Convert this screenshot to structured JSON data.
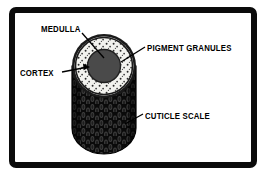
{
  "figure": {
    "frame_color": "#0b0b0b",
    "background_color": "#ffffff"
  },
  "labels": {
    "medulla": "MEDULLA",
    "pigment_granules": "PIGMENT GRANULES",
    "cortex": "CORTEX",
    "cuticle_scale": "CUTICLE SCALE"
  },
  "diagram": {
    "parts": [
      {
        "name": "medulla",
        "label": "MEDULLA",
        "description": "solid dark central core circle of the hair cross-section",
        "color": "#4a4a4a",
        "leader_from": [
          82,
          33
        ],
        "leader_to": [
          104,
          56
        ]
      },
      {
        "name": "cortex",
        "label": "CORTEX",
        "description": "light speckled ring surrounding the medulla",
        "color": "#f2f2ee",
        "leader_from": [
          62,
          72
        ],
        "leader_to": [
          88,
          66
        ]
      },
      {
        "name": "pigment-granules",
        "label": "PIGMENT GRANULES",
        "description": "small dark dots distributed through the cortex ring",
        "color": "#2a2a2a",
        "leader_from": [
          145,
          47
        ],
        "leader_to": [
          120,
          63
        ]
      },
      {
        "name": "cuticle-scale",
        "label": "CUTICLE SCALE",
        "description": "overlapping dark scales covering the outer cylinder shaft",
        "color": "#111111",
        "leader_from": [
          143,
          114
        ],
        "leader_to": [
          124,
          124
        ]
      }
    ],
    "colors": {
      "outer_rim": "#1a1a1a",
      "cortex_fill": "#f2f2ee",
      "medulla_fill": "#4a4a4a",
      "granule": "#2b2b2b",
      "shaft_dark": "#0d0d0d",
      "scale_light": "#3c3c3c",
      "leader_line": "#000000"
    }
  }
}
